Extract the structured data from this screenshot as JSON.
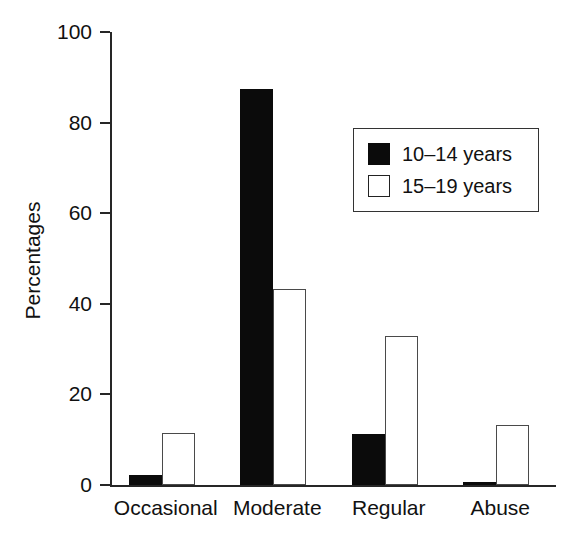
{
  "chart_data": {
    "type": "bar",
    "title": "",
    "subtitle": "",
    "xlabel": "",
    "ylabel": "Percentages",
    "categories": [
      "Occasional",
      "Moderate",
      "Regular",
      "Abuse"
    ],
    "series": [
      {
        "name": "10–14 years",
        "color": "#0b0b0b",
        "fill": "solid-black",
        "values": [
          2.2,
          87.5,
          11.3,
          0.7
        ]
      },
      {
        "name": "15–19 years",
        "color": "#ffffff",
        "fill": "white-outline",
        "values": [
          11.5,
          43.2,
          32.9,
          13.3
        ]
      }
    ],
    "ylim": [
      0,
      100
    ],
    "yticks": [
      0,
      20,
      40,
      60,
      80,
      100
    ],
    "ytick_labels": [
      "0",
      "20",
      "40",
      "60",
      "80",
      "100"
    ],
    "grid": false,
    "legend_position": "upper right",
    "legend_entries": [
      "10–14 years",
      "15–19 years"
    ],
    "bar_group_gap": true,
    "axis_color": "#262626",
    "background_color": "#ffffff"
  }
}
